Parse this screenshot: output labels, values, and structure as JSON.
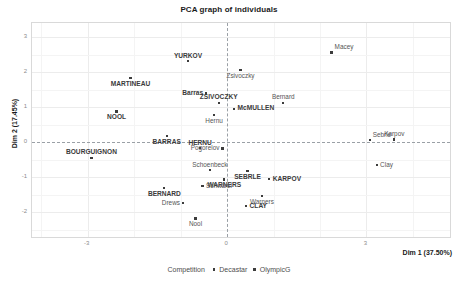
{
  "chart_data": {
    "type": "scatter",
    "title": "PCA graph of individuals",
    "xlabel": "Dim 1 (37.50%)",
    "ylabel": "Dim 2 (17.45%)",
    "xlim": [
      -4.2,
      4.8
    ],
    "ylim": [
      -2.7,
      3.4
    ],
    "xticks": [
      "-3",
      "0",
      "3"
    ],
    "xtick_values": [
      -3,
      0,
      3
    ],
    "yticks": [
      "3",
      "2",
      "1",
      "0",
      "-1",
      "-2"
    ],
    "ytick_values": [
      3,
      2,
      1,
      0,
      -1,
      -2
    ],
    "grid": true,
    "zero_lines": true,
    "legend": {
      "position": "bottom",
      "title": "Competition",
      "entries": [
        {
          "label": "Decastar",
          "marker": "dot"
        },
        {
          "label": "OlympicG",
          "marker": "dot"
        }
      ]
    },
    "points": [
      {
        "label": "YURKOV",
        "x": -0.84,
        "y": 2.31,
        "group": "Decastar",
        "label_pos": "above"
      },
      {
        "label": "Macey",
        "x": 2.25,
        "y": 2.56,
        "group": "OlympicG",
        "label_pos": "upper-right"
      },
      {
        "label": "MARTINEAU",
        "x": -2.08,
        "y": 1.84,
        "group": "Decastar",
        "label_pos": "below"
      },
      {
        "label": "Zsivoczky",
        "x": 0.29,
        "y": 2.05,
        "group": "OlympicG",
        "label_pos": "below"
      },
      {
        "label": "Barras",
        "x": -0.45,
        "y": 1.39,
        "group": "Decastar",
        "label_pos": "left"
      },
      {
        "label": "ZSIVOCZKY",
        "x": -0.18,
        "y": 1.12,
        "group": "Decastar",
        "label_pos": "above"
      },
      {
        "label": "Bernard",
        "x": 1.21,
        "y": 1.12,
        "group": "OlympicG",
        "label_pos": "above"
      },
      {
        "label": "McMULLEN",
        "x": 0.15,
        "y": 0.96,
        "group": "Decastar",
        "label_pos": "right"
      },
      {
        "label": "NOOL",
        "x": -2.38,
        "y": 0.88,
        "group": "Decastar",
        "label_pos": "below"
      },
      {
        "label": "Hernu",
        "x": -0.28,
        "y": 0.78,
        "group": "OlympicG",
        "label_pos": "below"
      },
      {
        "label": "BARRAS",
        "x": -1.3,
        "y": 0.19,
        "group": "Decastar",
        "label_pos": "below"
      },
      {
        "label": "Sebrle",
        "x": 3.07,
        "y": 0.07,
        "group": "OlympicG",
        "label_pos": "upper-right"
      },
      {
        "label": "Karpov",
        "x": 3.6,
        "y": 0.08,
        "group": "OlympicG",
        "label_pos": "above"
      },
      {
        "label": "HERNU",
        "x": -0.58,
        "y": -0.17,
        "group": "Decastar",
        "label_pos": "above"
      },
      {
        "label": "Pogorelov",
        "x": -0.1,
        "y": -0.18,
        "group": "OlympicG",
        "label_pos": "left"
      },
      {
        "label": "BOURGUIGNON",
        "x": -2.92,
        "y": -0.44,
        "group": "Decastar",
        "label_pos": "above"
      },
      {
        "label": "Clay",
        "x": 3.22,
        "y": -0.64,
        "group": "OlympicG",
        "label_pos": "right"
      },
      {
        "label": "Schoenbeck",
        "x": -0.37,
        "y": -0.8,
        "group": "OlympicG",
        "label_pos": "above"
      },
      {
        "label": "SEBRLE",
        "x": 0.44,
        "y": -0.83,
        "group": "Decastar",
        "label_pos": "below"
      },
      {
        "label": "WARNERS",
        "x": -0.06,
        "y": -1.06,
        "group": "Decastar",
        "label_pos": "below"
      },
      {
        "label": "KARPOV",
        "x": 0.91,
        "y": -1.04,
        "group": "Decastar",
        "label_pos": "right"
      },
      {
        "label": "Schwarzl",
        "x": -0.53,
        "y": -1.24,
        "group": "OlympicG",
        "label_pos": "right"
      },
      {
        "label": "BERNARD",
        "x": -1.35,
        "y": -1.31,
        "group": "Decastar",
        "label_pos": "below"
      },
      {
        "label": "Warners",
        "x": 0.75,
        "y": -1.52,
        "group": "OlympicG",
        "label_pos": "below"
      },
      {
        "label": "Drews",
        "x": -0.95,
        "y": -1.74,
        "group": "OlympicG",
        "label_pos": "left"
      },
      {
        "label": "CLAY",
        "x": 0.41,
        "y": -1.82,
        "group": "Decastar",
        "label_pos": "right"
      },
      {
        "label": "Nool",
        "x": -0.68,
        "y": -2.17,
        "group": "OlympicG",
        "label_pos": "below"
      }
    ]
  }
}
